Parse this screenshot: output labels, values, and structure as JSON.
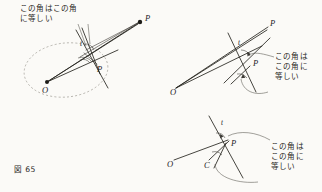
{
  "figure": {
    "caption": "図 65",
    "caption_number": "65",
    "background_color": "#fbfaf7",
    "ink_color": "#26251f",
    "dash_color": "#8e8b83"
  },
  "annotations": {
    "left_note": "この角はこの角\nに等しい",
    "right_note": "この角は\nこの角に\n等しい",
    "bottom_note": "この角は\nこの角に\n等しい"
  },
  "diagrams": [
    {
      "id": "left-diagram",
      "name": "circle-with-external-point",
      "points": [
        {
          "label": "O",
          "x": 47,
          "y": 82,
          "dot": true
        },
        {
          "label": "P",
          "x": 140,
          "y": 22,
          "dot": true
        },
        {
          "label": "P",
          "x": 97,
          "y": 66,
          "dot": false
        },
        {
          "label": "t",
          "x": 81,
          "y": 45,
          "dot": false
        }
      ],
      "has_dashed_circle": true,
      "angle_marks": 2
    },
    {
      "id": "right-top-diagram",
      "name": "tangent-and-chord-angles",
      "points": [
        {
          "label": "O",
          "x": 175,
          "y": 88,
          "dot": false
        },
        {
          "label": "P",
          "x": 262,
          "y": 28,
          "dot": false
        },
        {
          "label": "P",
          "x": 250,
          "y": 65,
          "dot": false
        },
        {
          "label": "t",
          "x": 238,
          "y": 43,
          "dot": false
        }
      ],
      "has_dashed_circle": false,
      "angle_marks": 2
    },
    {
      "id": "bottom-right-diagram",
      "name": "tangent-point-angles",
      "points": [
        {
          "label": "O",
          "x": 171,
          "y": 163,
          "dot": false
        },
        {
          "label": "C",
          "x": 208,
          "y": 163,
          "dot": false
        },
        {
          "label": "P",
          "x": 229,
          "y": 146,
          "dot": false
        },
        {
          "label": "t",
          "x": 222,
          "y": 124,
          "dot": false
        }
      ],
      "has_dashed_circle": false,
      "angle_marks": 2
    }
  ]
}
